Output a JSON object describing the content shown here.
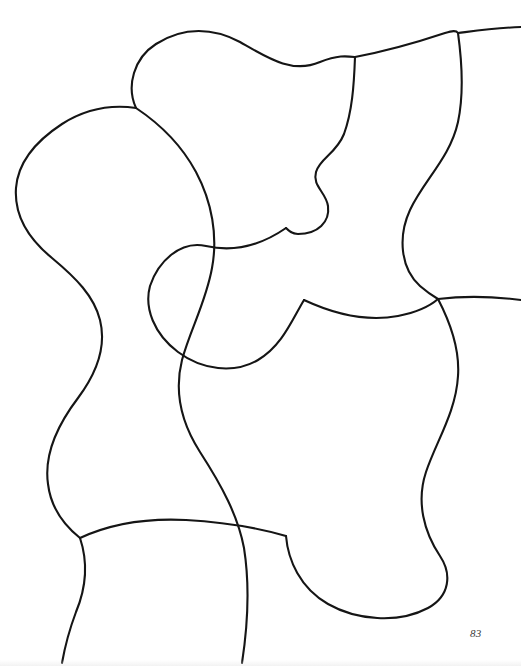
{
  "page": {
    "kind": "scanned-book-page",
    "width": 521,
    "height": 666,
    "background_color": "#ffffff",
    "page_number": "83"
  },
  "artwork": {
    "title": "",
    "description": "Abstract continuous-line drawing: interlocking meandering curves forming organic blob-like regions",
    "ink_color": "#151515",
    "stroke_width": 2.1,
    "curves": [
      {
        "name": "upper-left-lobe",
        "d": "M 136 108 C 126 86 134 58 156 44 C 184 26 214 28 240 42 C 268 58 292 74 320 62 C 338 55 346 56 355 57"
      },
      {
        "name": "top-ridge-to-right-edge",
        "d": "M 355 57 C 392 50 424 40 445 33 C 452 31 456 30 458 33 C 474 31 494 28 521 27"
      },
      {
        "name": "left-long-spine",
        "d": "M 136 108 C 108 104 84 110 62 124 C 36 141 18 162 16 188 C 14 216 30 240 52 258 C 76 278 94 296 100 320 C 107 348 96 374 78 398 C 56 427 44 456 48 484 C 51 509 65 526 80 538"
      },
      {
        "name": "lower-left-descender",
        "d": "M 80 538 C 88 562 86 588 76 612 C 70 628 65 646 62 663"
      },
      {
        "name": "left-to-center-sweep",
        "d": "M 80 538 C 110 524 146 518 186 520 C 224 522 258 528 286 536"
      },
      {
        "name": "center-s-spine",
        "d": "M 136 108 C 160 124 182 146 196 172 C 212 202 218 236 212 268 C 206 302 190 330 182 360 C 174 392 182 424 200 452 C 222 486 238 516 244 548 C 250 586 248 624 242 663"
      },
      {
        "name": "mid-left-hook",
        "d": "M 286 228 C 260 246 232 252 206 246 C 180 240 158 262 150 286 C 144 308 154 334 178 352 C 202 370 234 374 258 360 C 282 346 292 320 304 300"
      },
      {
        "name": "upper-center-bulge",
        "d": "M 355 57 C 354 86 352 112 344 134 C 336 154 320 158 316 172 C 312 186 326 192 328 206 C 330 222 318 234 298 234 C 292 234 289 231 286 228"
      },
      {
        "name": "right-descender-from-top",
        "d": "M 458 33 C 462 62 464 94 458 122 C 450 158 424 180 410 210 C 398 236 400 268 420 286 C 428 293 433 296 438 299"
      },
      {
        "name": "right-edge-horizontal",
        "d": "M 438 299 C 462 296 490 296 521 300"
      },
      {
        "name": "center-to-right-diagonal",
        "d": "M 304 300 C 334 314 366 322 398 316 C 418 312 430 306 438 299"
      },
      {
        "name": "right-lower-lobe",
        "d": "M 438 299 C 450 322 460 348 458 376 C 456 412 436 442 426 472 C 416 502 424 532 440 556 C 452 574 450 596 428 608 C 398 624 356 620 328 604 C 300 588 288 560 286 536"
      }
    ]
  }
}
